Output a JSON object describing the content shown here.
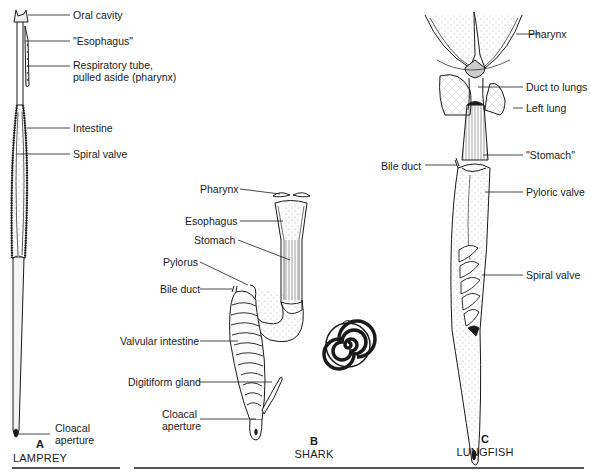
{
  "figure": {
    "panels": [
      {
        "letter": "A",
        "name": "LAMPREY",
        "labels": {
          "oral_cavity": "Oral cavity",
          "esophagus": "\"Esophagus\"",
          "respiratory_tube_1": "Respiratory tube,",
          "respiratory_tube_2": "pulled aside (pharynx)",
          "intestine": "Intestine",
          "spiral_valve": "Spiral valve",
          "cloacal_1": "Cloacal",
          "cloacal_2": "aperture"
        }
      },
      {
        "letter": "B",
        "name": "SHARK",
        "labels": {
          "pharynx": "Pharynx",
          "esophagus": "Esophagus",
          "stomach": "Stomach",
          "pylorus": "Pylorus",
          "bile_duct": "Bile duct",
          "valvular_intestine": "Valvular intestine",
          "digitiform_gland": "Digitiform gland",
          "cloacal_1": "Cloacal",
          "cloacal_2": "aperture"
        }
      },
      {
        "letter": "C",
        "name": "LUNGFISH",
        "labels": {
          "pharynx": "Pharynx",
          "duct_to_lungs": "Duct to lungs",
          "left_lung": "Left lung",
          "bile_duct": "Bile duct",
          "stomach": "\"Stomach\"",
          "pyloric_valve": "Pyloric valve",
          "spiral_valve": "Spiral valve"
        }
      }
    ],
    "colors": {
      "ink": "#1a1a1a",
      "shade": "#d9d9d9",
      "background": "#ffffff",
      "rule": "#555555"
    }
  }
}
